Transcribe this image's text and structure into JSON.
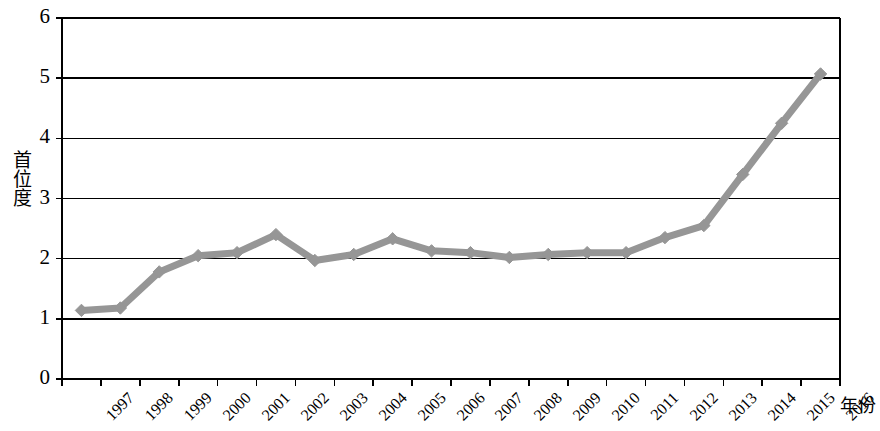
{
  "chart_data": {
    "type": "line",
    "title": "",
    "xlabel": "年份",
    "ylabel": "首位度",
    "ylim": [
      0,
      6
    ],
    "yticks": [
      0,
      1,
      2,
      3,
      4,
      5,
      6
    ],
    "grid": true,
    "legend": "none",
    "series_color": "#969696",
    "axis_color": "#000000",
    "marker": "diamond",
    "categories": [
      "1997",
      "1998",
      "1999",
      "2000",
      "2001",
      "2002",
      "2003",
      "2004",
      "2005",
      "2006",
      "2007",
      "2008",
      "2009",
      "2010",
      "2011",
      "2012",
      "2013",
      "2014",
      "2015",
      "2016"
    ],
    "series": [
      {
        "name": "首位度",
        "values": [
          1.14,
          1.18,
          1.78,
          2.05,
          2.1,
          2.4,
          1.97,
          2.07,
          2.33,
          2.13,
          2.1,
          2.02,
          2.07,
          2.1,
          2.1,
          2.35,
          2.55,
          3.4,
          4.25,
          5.07
        ]
      }
    ]
  },
  "axis": {
    "y_title": "首位度",
    "x_title": "年份",
    "y_tick_labels": [
      "6",
      "5",
      "4",
      "3",
      "2",
      "1",
      "0"
    ]
  }
}
